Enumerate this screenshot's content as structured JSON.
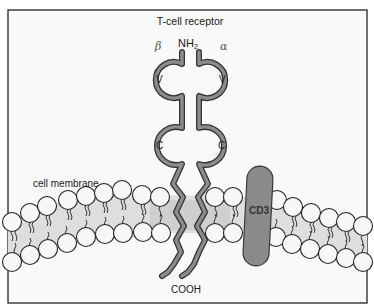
{
  "diagram": {
    "title": "T-cell receptor",
    "chains": {
      "beta": {
        "label": "β"
      },
      "alpha": {
        "label": "α"
      }
    },
    "n_terminus": {
      "label": "NH",
      "subscript": "2"
    },
    "domains": {
      "beta_variable": "V",
      "alpha_variable": "V",
      "beta_constant": "C",
      "alpha_constant": "C"
    },
    "membrane_label": "cell membrane",
    "coreceptor_label": "CD3",
    "c_terminus_label": "COOH",
    "colors": {
      "background": "#f9f9f9",
      "frame": "#333333",
      "chain_fill": "#8c8c8c",
      "chain_outline": "#333333",
      "membrane_band": "#dcdcdc",
      "lipid_head": "#f7f7f7",
      "cd3_fill": "#8a8a8a"
    }
  }
}
